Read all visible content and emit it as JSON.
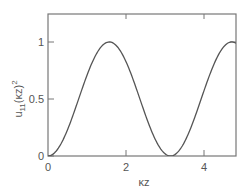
{
  "chart_data": {
    "type": "line",
    "title": "",
    "xlabel": "κz",
    "ylabel": "u₁₁(κz)²",
    "xlim": [
      0,
      4.82
    ],
    "ylim": [
      0,
      1.245
    ],
    "grid": false,
    "legend": null,
    "x_ticks": [
      0,
      2,
      4
    ],
    "x_tick_labels": [
      "0",
      "2",
      "4"
    ],
    "y_ticks": [
      0,
      0.5,
      1
    ],
    "y_tick_labels": [
      "0",
      "0.5",
      "1"
    ],
    "series": [
      {
        "name": "u11(κz)^2 = sin²(κz)",
        "function": "sin^2",
        "x": [
          0,
          0.4,
          0.8,
          1.2,
          1.571,
          2.0,
          2.4,
          2.8,
          3.142,
          3.5,
          3.9,
          4.3,
          4.712,
          4.82
        ],
        "values": [
          0,
          0.152,
          0.515,
          0.869,
          1.0,
          0.827,
          0.455,
          0.112,
          0,
          0.123,
          0.474,
          0.839,
          1.0,
          0.988
        ]
      }
    ],
    "line_color": "#555555",
    "frame_color": "#777777"
  },
  "axes": {
    "x_label": "κz",
    "y_label_main": "u",
    "y_label_sub": "11",
    "y_label_rest": "(κz)",
    "y_label_sup": "2",
    "x_tick_labels": [
      "0",
      "2",
      "4"
    ],
    "y_tick_labels": [
      "0",
      "0.5",
      "1"
    ]
  }
}
